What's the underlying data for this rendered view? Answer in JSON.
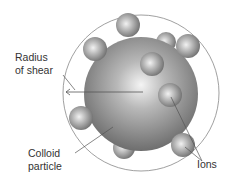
{
  "diagram": {
    "labels": {
      "radius_of_shear_line1": "Radius",
      "radius_of_shear_line2": "of shear",
      "colloid_line1": "Colloid",
      "colloid_line2": "particle",
      "ions": "Ions"
    },
    "colors": {
      "outline": "#888888",
      "sphere_light": "#f2f2f2",
      "sphere_dark": "#6a6a6a",
      "text": "#333333"
    }
  }
}
